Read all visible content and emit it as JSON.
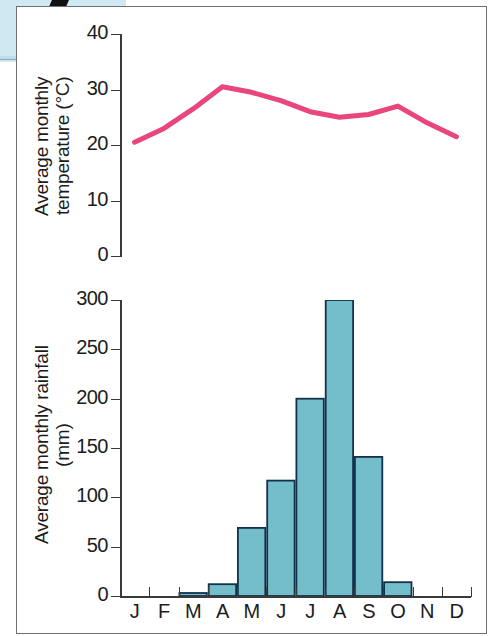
{
  "figure": {
    "panel_border_color": "#6d6f72",
    "background_patch_color": "#cfe9f2"
  },
  "temperature_chart": {
    "axis_title_line1": "Average monthly",
    "axis_title_line2": "temperature (°C)",
    "y_ticks": [
      "0",
      "10",
      "20",
      "30",
      "40"
    ],
    "line_color": "#e8467c"
  },
  "rainfall_chart": {
    "axis_title_line1": "Average monthly rainfall",
    "axis_title_line2": "(mm)",
    "y_ticks": [
      "0",
      "50",
      "100",
      "150",
      "200",
      "250",
      "300"
    ],
    "bar_fill_color": "#74becc",
    "bar_stroke_color": "#14314a",
    "x_labels": [
      "J",
      "F",
      "M",
      "A",
      "M",
      "J",
      "J",
      "A",
      "S",
      "O",
      "N",
      "D"
    ]
  },
  "chart_data": [
    {
      "type": "line",
      "title": "",
      "xlabel": "",
      "ylabel": "Average monthly temperature (°C)",
      "categories": [
        "J",
        "F",
        "M",
        "A",
        "M",
        "J",
        "J",
        "A",
        "S",
        "O",
        "N",
        "D"
      ],
      "values": [
        20.5,
        23.0,
        26.5,
        30.5,
        29.5,
        28.0,
        26.0,
        25.0,
        25.5,
        27.0,
        24.0,
        21.5
      ],
      "ylim": [
        0,
        40
      ],
      "ytick_step": 10,
      "grid": false,
      "legend": "none",
      "color": "#e8467c",
      "units": "°C"
    },
    {
      "type": "bar",
      "title": "",
      "xlabel": "",
      "ylabel": "Average monthly rainfall (mm)",
      "categories": [
        "J",
        "F",
        "M",
        "A",
        "M",
        "J",
        "J",
        "A",
        "S",
        "O",
        "N",
        "D"
      ],
      "values": [
        0,
        0,
        3,
        12,
        69,
        117,
        200,
        300,
        141,
        14,
        0,
        0
      ],
      "ylim": [
        0,
        300
      ],
      "ytick_step": 50,
      "grid": false,
      "legend": "none",
      "color": "#74becc",
      "units": "mm"
    }
  ]
}
